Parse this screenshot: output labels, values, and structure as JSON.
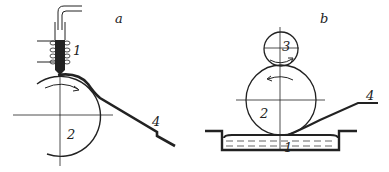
{
  "panels": [
    {
      "id": "a",
      "label": "a",
      "parts": {
        "p1": "1",
        "p2": "2",
        "p4": "4"
      }
    },
    {
      "id": "b",
      "label": "b",
      "parts": {
        "p1": "1",
        "p2": "2",
        "p3": "3",
        "p4": "4"
      }
    }
  ],
  "colors": {
    "stroke": "#222222",
    "background": "#ffffff"
  }
}
